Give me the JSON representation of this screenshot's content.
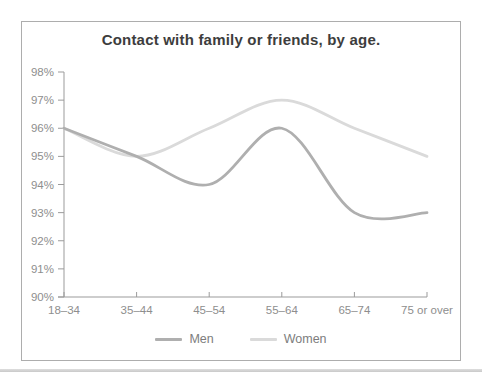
{
  "chart_data": {
    "type": "line",
    "title": "Contact with family or friends, by age.",
    "categories": [
      "18–34",
      "35–44",
      "45–54",
      "55–64",
      "65–74",
      "75 or over"
    ],
    "series": [
      {
        "name": "Men",
        "color": "#afafaf",
        "values": [
          96,
          95,
          94,
          96,
          93,
          93
        ]
      },
      {
        "name": "Women",
        "color": "#dadada",
        "values": [
          96,
          95,
          96,
          97,
          96,
          95
        ]
      }
    ],
    "ylim": [
      90,
      98
    ],
    "ytick_labels": [
      "90%",
      "91%",
      "92%",
      "93%",
      "94%",
      "95%",
      "96%",
      "97%",
      "98%"
    ],
    "xlabel": "",
    "ylabel": "",
    "grid": false,
    "smooth": true,
    "legend_position": "bottom",
    "axis_color": "#9b9b9b",
    "tick_label_color": "#8e8e8e"
  },
  "panel": {
    "border_color": "#adadad",
    "background": "#ffffff"
  },
  "separator": {
    "color": "#d2d2d2"
  }
}
